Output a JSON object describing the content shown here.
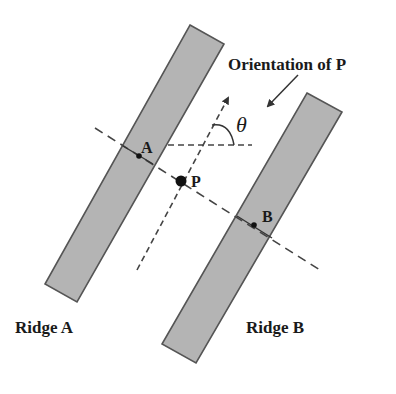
{
  "diagram": {
    "title_label": "Orientation of P",
    "ridges": [
      {
        "name": "Ridge A",
        "label": "Ridge A",
        "point_label": "A"
      },
      {
        "name": "Ridge B",
        "label": "Ridge B",
        "point_label": "B"
      }
    ],
    "center_point_label": "P",
    "angle_label": "θ",
    "colors": {
      "ridge_fill": "#b4b4b4",
      "ridge_stroke": "#555555",
      "line": "#444444",
      "text": "#1a1a1a"
    }
  }
}
